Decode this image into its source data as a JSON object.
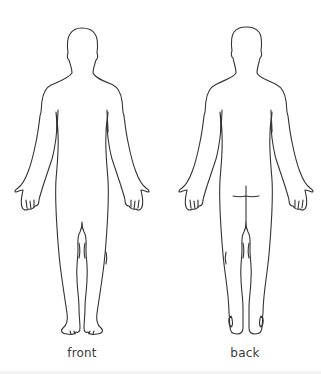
{
  "diagram": {
    "figures": [
      {
        "id": "front",
        "label": "front"
      },
      {
        "id": "back",
        "label": "back"
      }
    ],
    "colors": {
      "outline": "#333333",
      "label": "#3a3a3a",
      "background": "#ffffff"
    }
  }
}
